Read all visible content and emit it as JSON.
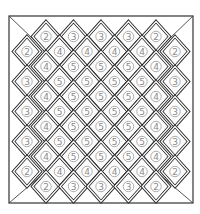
{
  "board": {
    "frame": {
      "x": 9,
      "y": 16,
      "width": 184,
      "height": 187
    },
    "diamond": {
      "half_width": 13.5,
      "half_height": 15
    },
    "colors": {
      "border": "#2a2a2a",
      "number": "#8a8a8a",
      "background": "#ffffff"
    },
    "rows": [
      {
        "y": 36.5,
        "cells": [
          {
            "x": 46,
            "v": "2"
          },
          {
            "x": 73.5,
            "v": "3"
          },
          {
            "x": 101,
            "v": "3"
          },
          {
            "x": 128.5,
            "v": "3"
          },
          {
            "x": 156,
            "v": "2"
          }
        ]
      },
      {
        "y": 51.5,
        "cells": [
          {
            "x": 27,
            "v": "2"
          },
          {
            "x": 59.5,
            "v": "4"
          },
          {
            "x": 87,
            "v": "4"
          },
          {
            "x": 114.5,
            "v": "4"
          },
          {
            "x": 142,
            "v": "4"
          },
          {
            "x": 175,
            "v": "2"
          }
        ]
      },
      {
        "y": 66.5,
        "cells": [
          {
            "x": 46,
            "v": "4"
          },
          {
            "x": 73.5,
            "v": "5"
          },
          {
            "x": 101,
            "v": "5"
          },
          {
            "x": 128.5,
            "v": "5"
          },
          {
            "x": 156,
            "v": "4"
          }
        ]
      },
      {
        "y": 81.5,
        "cells": [
          {
            "x": 27,
            "v": "3"
          },
          {
            "x": 59.5,
            "v": "5"
          },
          {
            "x": 87,
            "v": "5"
          },
          {
            "x": 114.5,
            "v": "5"
          },
          {
            "x": 142,
            "v": "5"
          },
          {
            "x": 175,
            "v": "3"
          }
        ]
      },
      {
        "y": 96.5,
        "cells": [
          {
            "x": 46,
            "v": "4"
          },
          {
            "x": 73.5,
            "v": "5"
          },
          {
            "x": 101,
            "v": "5"
          },
          {
            "x": 128.5,
            "v": "5"
          },
          {
            "x": 156,
            "v": "4"
          }
        ]
      },
      {
        "y": 111.5,
        "cells": [
          {
            "x": 27,
            "v": "3"
          },
          {
            "x": 59.5,
            "v": "5"
          },
          {
            "x": 87,
            "v": "5"
          },
          {
            "x": 114.5,
            "v": "5"
          },
          {
            "x": 142,
            "v": "5"
          },
          {
            "x": 175,
            "v": "3"
          }
        ]
      },
      {
        "y": 126.5,
        "cells": [
          {
            "x": 46,
            "v": "4"
          },
          {
            "x": 73.5,
            "v": "5"
          },
          {
            "x": 101,
            "v": "5"
          },
          {
            "x": 128.5,
            "v": "5"
          },
          {
            "x": 156,
            "v": "4"
          }
        ]
      },
      {
        "y": 141.5,
        "cells": [
          {
            "x": 27,
            "v": "3"
          },
          {
            "x": 59.5,
            "v": "5"
          },
          {
            "x": 87,
            "v": "5"
          },
          {
            "x": 114.5,
            "v": "5"
          },
          {
            "x": 142,
            "v": "5"
          },
          {
            "x": 175,
            "v": "3"
          }
        ]
      },
      {
        "y": 156.5,
        "cells": [
          {
            "x": 46,
            "v": "4"
          },
          {
            "x": 73.5,
            "v": "5"
          },
          {
            "x": 101,
            "v": "5"
          },
          {
            "x": 128.5,
            "v": "5"
          },
          {
            "x": 156,
            "v": "4"
          }
        ]
      },
      {
        "y": 171.5,
        "cells": [
          {
            "x": 27,
            "v": "2"
          },
          {
            "x": 59.5,
            "v": "4"
          },
          {
            "x": 87,
            "v": "4"
          },
          {
            "x": 114.5,
            "v": "4"
          },
          {
            "x": 142,
            "v": "4"
          },
          {
            "x": 175,
            "v": "2"
          }
        ]
      },
      {
        "y": 186.5,
        "cells": [
          {
            "x": 46,
            "v": "2"
          },
          {
            "x": 73.5,
            "v": "3"
          },
          {
            "x": 101,
            "v": "3"
          },
          {
            "x": 128.5,
            "v": "3"
          },
          {
            "x": 156,
            "v": "2"
          }
        ]
      }
    ]
  }
}
